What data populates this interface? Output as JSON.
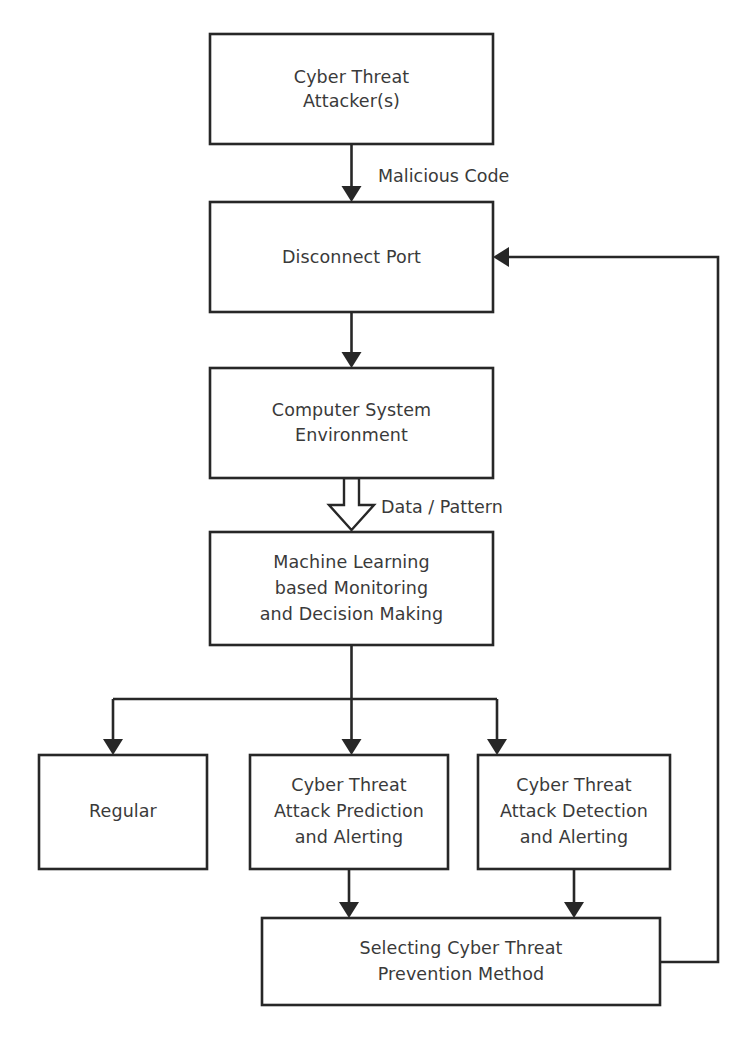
{
  "diagram": {
    "background_color": "#ffffff",
    "stroke_color": "#272727",
    "text_color": "#3a3a3a",
    "width": 751,
    "height": 1043
  },
  "nodes": [
    {
      "id": "attacker",
      "lines": [
        "Cyber Threat",
        "Attacker(s)"
      ],
      "line1": "Cyber Threat",
      "line2": "Attacker(s)",
      "x": 210,
      "y": 34,
      "w": 283,
      "h": 110
    },
    {
      "id": "disconnect-port",
      "lines": [
        "Disconnect Port"
      ],
      "line1": "Disconnect Port",
      "x": 210,
      "y": 202,
      "w": 283,
      "h": 110
    },
    {
      "id": "computer-system-environment",
      "lines": [
        "Computer System",
        "Environment"
      ],
      "line1": "Computer System",
      "line2": "Environment",
      "x": 210,
      "y": 368,
      "w": 283,
      "h": 110
    },
    {
      "id": "machine-learning",
      "lines": [
        "Machine Learning",
        "based Monitoring",
        "and Decision Making"
      ],
      "line1": "Machine Learning",
      "line2": "based Monitoring",
      "line3": "and Decision Making",
      "x": 210,
      "y": 532,
      "w": 283,
      "h": 113
    },
    {
      "id": "regular",
      "lines": [
        "Regular"
      ],
      "line1": "Regular",
      "x": 39,
      "y": 755,
      "w": 168,
      "h": 114
    },
    {
      "id": "attack-prediction",
      "lines": [
        "Cyber Threat",
        "Attack Prediction",
        "and Alerting"
      ],
      "line1": "Cyber Threat",
      "line2": "Attack Prediction",
      "line3": "and Alerting",
      "x": 250,
      "y": 755,
      "w": 198,
      "h": 114
    },
    {
      "id": "attack-detection",
      "lines": [
        "Cyber Threat",
        "Attack Detection",
        "and Alerting"
      ],
      "line1": "Cyber Threat",
      "line2": "Attack Detection",
      "line3": "and Alerting",
      "x": 478,
      "y": 755,
      "w": 192,
      "h": 114
    },
    {
      "id": "prevention-method",
      "lines": [
        "Selecting Cyber Threat",
        "Prevention Method"
      ],
      "line1": "Selecting Cyber Threat",
      "line2": "Prevention Method",
      "x": 262,
      "y": 918,
      "w": 398,
      "h": 87
    }
  ],
  "edges": [
    {
      "id": "attacker-to-disconnect",
      "from": "attacker",
      "to": "disconnect-port",
      "label": "Malicious Code",
      "arrow_style": "solid"
    },
    {
      "id": "disconnect-to-environment",
      "from": "disconnect-port",
      "to": "computer-system-environment",
      "label": "",
      "arrow_style": "solid"
    },
    {
      "id": "environment-to-ml",
      "from": "computer-system-environment",
      "to": "machine-learning",
      "label": "Data / Pattern",
      "arrow_style": "hollow-block"
    },
    {
      "id": "ml-to-regular",
      "from": "machine-learning",
      "to": "regular",
      "label": "",
      "arrow_style": "solid"
    },
    {
      "id": "ml-to-prediction",
      "from": "machine-learning",
      "to": "attack-prediction",
      "label": "",
      "arrow_style": "solid"
    },
    {
      "id": "ml-to-detection",
      "from": "machine-learning",
      "to": "attack-detection",
      "label": "",
      "arrow_style": "solid"
    },
    {
      "id": "prediction-to-prevention",
      "from": "attack-prediction",
      "to": "prevention-method",
      "label": "",
      "arrow_style": "solid"
    },
    {
      "id": "detection-to-prevention",
      "from": "attack-detection",
      "to": "prevention-method",
      "label": "",
      "arrow_style": "solid"
    },
    {
      "id": "prevention-feedback-to-disconnect",
      "from": "prevention-method",
      "to": "disconnect-port",
      "label": "",
      "arrow_style": "solid"
    }
  ],
  "edge_labels": {
    "malicious_code": "Malicious Code",
    "data_pattern": "Data / Pattern"
  },
  "caption": ""
}
